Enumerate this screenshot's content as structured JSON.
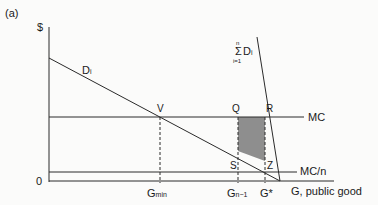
{
  "figure": {
    "panel_label": "(a)",
    "y_axis_label": "$",
    "origin_label": "0",
    "x_axis_label": "G, public good",
    "curves": {
      "individual_demand": {
        "label": "D",
        "subscript": "i"
      },
      "aggregate_demand": {
        "sum_top": "n",
        "sum_sign": "Σ",
        "sum_bottom": "i=1",
        "label": "D",
        "subscript": "i"
      },
      "marginal_cost": {
        "label": "MC"
      },
      "marginal_cost_per_person": {
        "label": "MC/n"
      }
    },
    "points": {
      "v": "V",
      "q": "Q",
      "r": "R",
      "s": "S",
      "z": "Z"
    },
    "x_ticks": {
      "g_min": {
        "label": "G",
        "subscript": "min"
      },
      "g_n_minus_1": {
        "label": "G",
        "subscript": "n−1"
      },
      "g_star": {
        "label": "G*"
      }
    },
    "colors": {
      "line": "#2a2a2a",
      "shade": "#8c8c8c",
      "background": "#fbfbfa"
    }
  }
}
